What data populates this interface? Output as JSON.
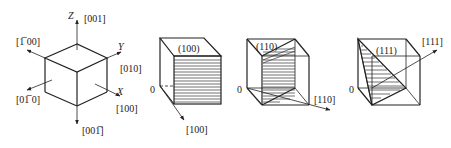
{
  "figure": {
    "panel1": {
      "axes": {
        "z": "Z",
        "y": "Y",
        "x": "X"
      },
      "directions": {
        "d001": "[001]",
        "d_100": "[1̅ 00]",
        "d010": "[010]",
        "d0_10": "[01̅ 0]",
        "d100": "[100]",
        "d00_1": "[001̅]"
      }
    },
    "panel2": {
      "plane": "(100)",
      "origin": "0",
      "direction": "[100]"
    },
    "panel3": {
      "plane": "(110)",
      "origin": "0",
      "direction": "[110]"
    },
    "panel4": {
      "plane": "(111)",
      "origin": "0",
      "direction": "[111]"
    }
  }
}
